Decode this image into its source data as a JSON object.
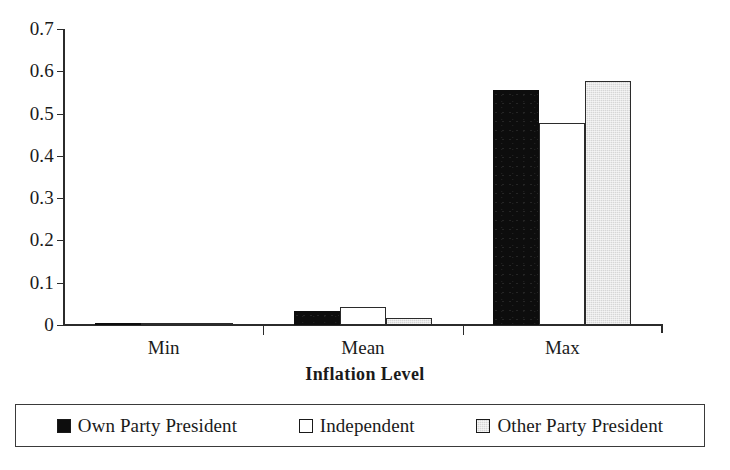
{
  "chart_data": {
    "type": "bar",
    "title": "",
    "xlabel": "Inflation Level",
    "ylabel": "",
    "categories": [
      "Min",
      "Mean",
      "Max"
    ],
    "series": [
      {
        "name": "Own Party President",
        "values": [
          0.0,
          0.032,
          0.555
        ],
        "color": "#0d0d0d"
      },
      {
        "name": "Independent",
        "values": [
          0.0,
          0.042,
          0.478
        ],
        "color": "#ffffff"
      },
      {
        "name": "Other Party President",
        "values": [
          0.0,
          0.016,
          0.578
        ],
        "color": "#d6d6d6"
      }
    ],
    "ylim": [
      0,
      0.7
    ],
    "ytick_labels": [
      "0.7",
      "0.6",
      "0.5",
      "0.4",
      "0.3",
      "0.2",
      "0.1",
      "0"
    ],
    "ytick_values": [
      0.7,
      0.6,
      0.5,
      0.4,
      0.3,
      0.2,
      0.1,
      0
    ],
    "grid": false,
    "legend_position": "bottom"
  },
  "axis": {
    "x_title": "Inflation Level"
  },
  "legend": {
    "items": [
      {
        "label": "Own Party President"
      },
      {
        "label": "Independent"
      },
      {
        "label": "Other Party President"
      }
    ]
  }
}
